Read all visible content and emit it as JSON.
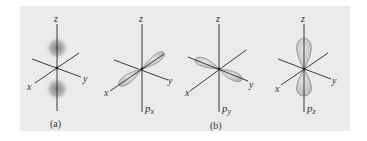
{
  "figure": {
    "panel_color": "#ebebeb",
    "axis_color": "#3a3a3a",
    "lobe_fill": "#cfcfcf",
    "lobe_stroke": "#8a8a8a",
    "diffuse_color": "#8c8c8c"
  },
  "panels": [
    {
      "id": "a",
      "type": "diffuse-p-orbital",
      "axis_labels": {
        "z": "z",
        "x": "x",
        "y": "y"
      },
      "caption": "(a)"
    },
    {
      "id": "px",
      "type": "p-orbital",
      "orientation": "x",
      "axis_labels": {
        "z": "z",
        "x": "x",
        "y": "y"
      },
      "orbital_label": {
        "base": "p",
        "sub": "x"
      }
    },
    {
      "id": "py",
      "type": "p-orbital",
      "orientation": "y",
      "axis_labels": {
        "z": "z",
        "x": "x",
        "y": "y"
      },
      "orbital_label": {
        "base": "p",
        "sub": "y"
      },
      "caption": "(b)"
    },
    {
      "id": "pz",
      "type": "p-orbital",
      "orientation": "z",
      "axis_labels": {
        "z": "z",
        "x": "x",
        "y": "y"
      },
      "orbital_label": {
        "base": "p",
        "sub": "z"
      }
    }
  ]
}
